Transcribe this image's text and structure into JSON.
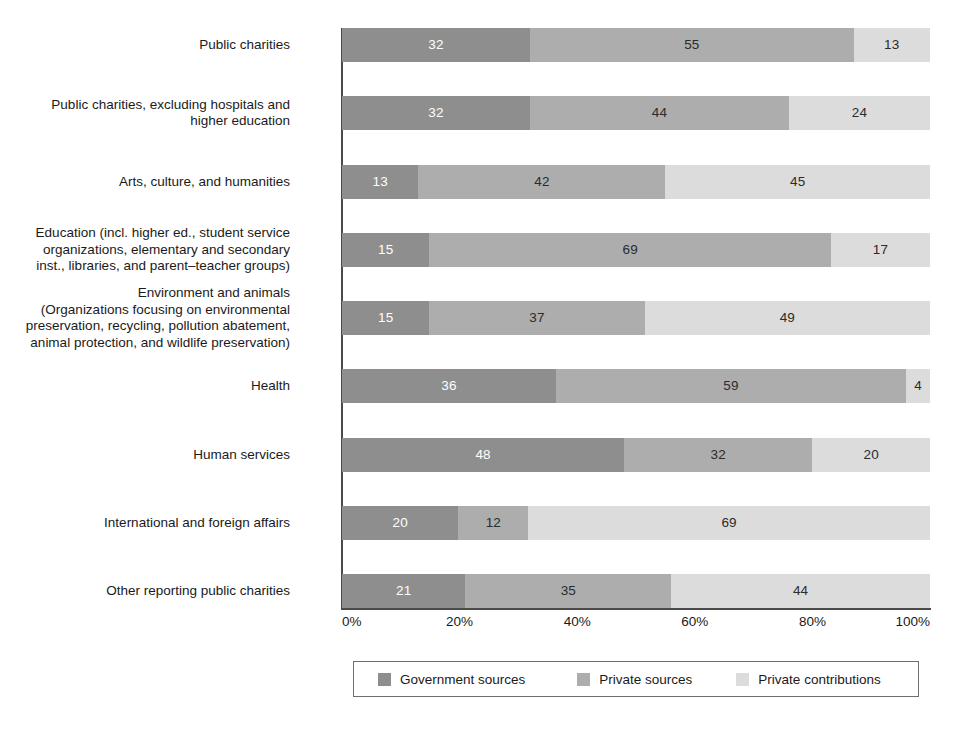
{
  "chart_data": {
    "type": "bar",
    "orientation": "horizontal",
    "stacked": true,
    "normalized_percent": true,
    "title": "",
    "subtitle": "",
    "xlabel": "",
    "ylabel": "",
    "xlim": [
      0,
      100
    ],
    "xticks": [
      "0%",
      "20%",
      "40%",
      "60%",
      "80%",
      "100%"
    ],
    "xtick_values": [
      0,
      20,
      40,
      60,
      80,
      100
    ],
    "grid": false,
    "legend_position": "bottom",
    "categories": [
      "Public charities",
      "Public charities, excluding hospitals and\nhigher education",
      "Arts, culture, and humanities",
      "Education (incl. higher ed., student service\norganizations, elementary and secondary\ninst., libraries, and parent–teacher groups)",
      "Environment and animals\n(Organizations focusing on environmental\npreservation, recycling, pollution abatement,\nanimal protection, and wildlife preservation)",
      "Health",
      "Human services",
      "International and foreign affairs",
      "Other reporting public charities"
    ],
    "series": [
      {
        "name": "Government sources",
        "color": "#8e8e8e",
        "values": [
          32,
          32,
          13,
          15,
          15,
          36,
          48,
          20,
          21
        ]
      },
      {
        "name": "Private sources",
        "color": "#adadad",
        "values": [
          55,
          44,
          42,
          69,
          37,
          59,
          32,
          12,
          35
        ]
      },
      {
        "name": "Private contributions",
        "color": "#dcdcdc",
        "values": [
          13,
          24,
          45,
          17,
          49,
          4,
          20,
          69,
          44
        ]
      }
    ]
  },
  "colors": {
    "government_sources": "#8e8e8e",
    "private_sources": "#adadad",
    "private_contributions": "#dcdcdc",
    "axis": "#4a4a4a",
    "text": "#1a1a1a",
    "background": "#ffffff"
  }
}
